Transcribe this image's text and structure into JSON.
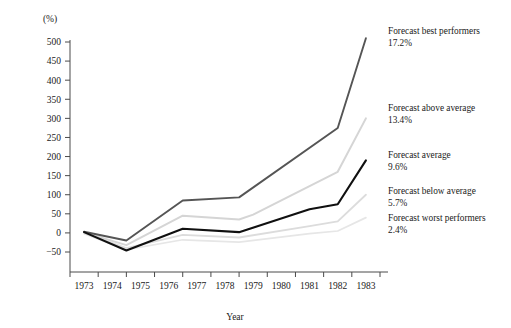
{
  "chart_data": {
    "type": "line",
    "title": "",
    "xlabel": "Year",
    "ylabel": "",
    "unit_label": "(%)",
    "x": [
      1973,
      1974,
      1974.5,
      1975,
      1976,
      1976.5,
      1977,
      1978,
      1978.5,
      1979,
      1980,
      1981,
      1982,
      1982.5,
      1983
    ],
    "categories": [
      "1973",
      "1974",
      "1975",
      "1976",
      "1977",
      "1978",
      "1979",
      "1980",
      "1981",
      "1982",
      "1983"
    ],
    "xlim": [
      1972.5,
      1983.5
    ],
    "ylim": [
      -50,
      500
    ],
    "yticks": [
      -50,
      0,
      50,
      100,
      150,
      200,
      250,
      300,
      350,
      400,
      450,
      500
    ],
    "ytick_labels": [
      "−50",
      "0",
      "50",
      "100",
      "150",
      "200",
      "250",
      "300",
      "350",
      "400",
      "450",
      "500"
    ],
    "grid": false,
    "legend_position": "right-outside",
    "series": [
      {
        "name": "Forecast best performers",
        "value_label": "17.2%",
        "color": "#555555",
        "width": 1.9,
        "points": [
          [
            1973,
            3
          ],
          [
            1974.5,
            -20
          ],
          [
            1976.5,
            85
          ],
          [
            1978.5,
            93
          ],
          [
            1982,
            275
          ],
          [
            1983,
            510
          ]
        ]
      },
      {
        "name": "Forecast above average",
        "value_label": "13.4%",
        "color": "#d5d5d5",
        "width": 2.0,
        "points": [
          [
            1973,
            1
          ],
          [
            1974.5,
            -32
          ],
          [
            1976.5,
            45
          ],
          [
            1978.5,
            35
          ],
          [
            1979,
            48
          ],
          [
            1982,
            160
          ],
          [
            1983,
            300
          ]
        ]
      },
      {
        "name": "Forecast average",
        "value_label": "9.6%",
        "color": "#101010",
        "width": 2.1,
        "points": [
          [
            1973,
            2
          ],
          [
            1974.5,
            -46
          ],
          [
            1976.5,
            11
          ],
          [
            1978.5,
            2
          ],
          [
            1981,
            62
          ],
          [
            1982,
            75
          ],
          [
            1983,
            190
          ]
        ]
      },
      {
        "name": "Forecast below average",
        "value_label": "5.7%",
        "color": "#dcdcdc",
        "width": 1.8,
        "points": [
          [
            1973,
            0
          ],
          [
            1974.5,
            -40
          ],
          [
            1976.5,
            -5
          ],
          [
            1978.5,
            -12
          ],
          [
            1981,
            18
          ],
          [
            1982,
            30
          ],
          [
            1983,
            100
          ]
        ]
      },
      {
        "name": "Forecast worst performers",
        "value_label": "2.4%",
        "color": "#e6e6e6",
        "width": 1.7,
        "points": [
          [
            1973,
            -2
          ],
          [
            1974.5,
            -44
          ],
          [
            1976.5,
            -18
          ],
          [
            1978.5,
            -24
          ],
          [
            1981,
            -2
          ],
          [
            1982,
            5
          ],
          [
            1983,
            40
          ]
        ]
      }
    ]
  },
  "legend": {
    "entries": [
      {
        "name": "Forecast best performers",
        "value": "17.2%"
      },
      {
        "name": "Forecast above average",
        "value": "13.4%"
      },
      {
        "name": "Forecast average",
        "value": "9.6%"
      },
      {
        "name": "Forecast below average",
        "value": "5.7%"
      },
      {
        "name": "Forecast worst performers",
        "value": "2.4%"
      }
    ]
  }
}
